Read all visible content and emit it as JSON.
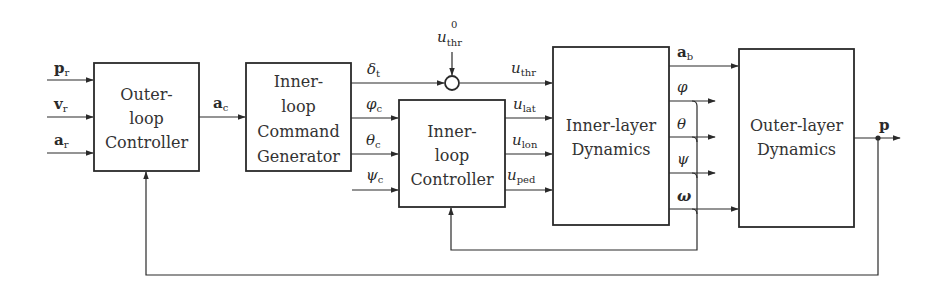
{
  "diagram": {
    "blocks": [
      {
        "id": "outer_loop_controller",
        "lines": [
          "Outer-",
          "loop",
          "Controller"
        ]
      },
      {
        "id": "inner_loop_command_generator",
        "lines": [
          "Inner-",
          "loop",
          "Command",
          "Generator"
        ]
      },
      {
        "id": "inner_loop_controller",
        "lines": [
          "Inner-",
          "loop",
          "Controller"
        ]
      },
      {
        "id": "inner_layer_dynamics",
        "lines": [
          "Inner-layer",
          "Dynamics"
        ]
      },
      {
        "id": "outer_layer_dynamics",
        "lines": [
          "Outer-layer",
          "Dynamics"
        ]
      }
    ],
    "inputs": [
      {
        "symbol": "p",
        "sub": "r",
        "bold": true
      },
      {
        "symbol": "v",
        "sub": "r",
        "bold": true
      },
      {
        "symbol": "a",
        "sub": "r",
        "bold": true
      }
    ],
    "signals": {
      "a_c": {
        "symbol": "a",
        "sub": "c",
        "bold": true
      },
      "delta_t": {
        "symbol": "δ",
        "sub": "t"
      },
      "phi_c": {
        "symbol": "φ",
        "sub": "c"
      },
      "theta_c": {
        "symbol": "θ",
        "sub": "c"
      },
      "psi_c": {
        "symbol": "ψ",
        "sub": "c"
      },
      "u_thr0": {
        "symbol": "u",
        "sub": "thr",
        "sup": "0"
      },
      "u_thr": {
        "symbol": "u",
        "sub": "thr"
      },
      "u_lat": {
        "symbol": "u",
        "sub": "lat"
      },
      "u_lon": {
        "symbol": "u",
        "sub": "lon"
      },
      "u_ped": {
        "symbol": "u",
        "sub": "ped"
      },
      "a_b": {
        "symbol": "a",
        "sub": "b",
        "bold": true
      },
      "phi": {
        "symbol": "φ"
      },
      "theta": {
        "symbol": "θ"
      },
      "psi": {
        "symbol": "ψ"
      },
      "omega": {
        "symbol": "ω",
        "bold": true
      },
      "p": {
        "symbol": "p",
        "bold": true
      }
    },
    "summing_junction": {
      "inputs": [
        "δ_t",
        "u_thr^0"
      ],
      "output": "u_thr"
    },
    "feedback_loops": [
      {
        "from": "φ, θ, ψ, ω",
        "to": "Inner-loop Controller"
      },
      {
        "from": "p",
        "to": "Outer-loop Controller"
      }
    ]
  }
}
